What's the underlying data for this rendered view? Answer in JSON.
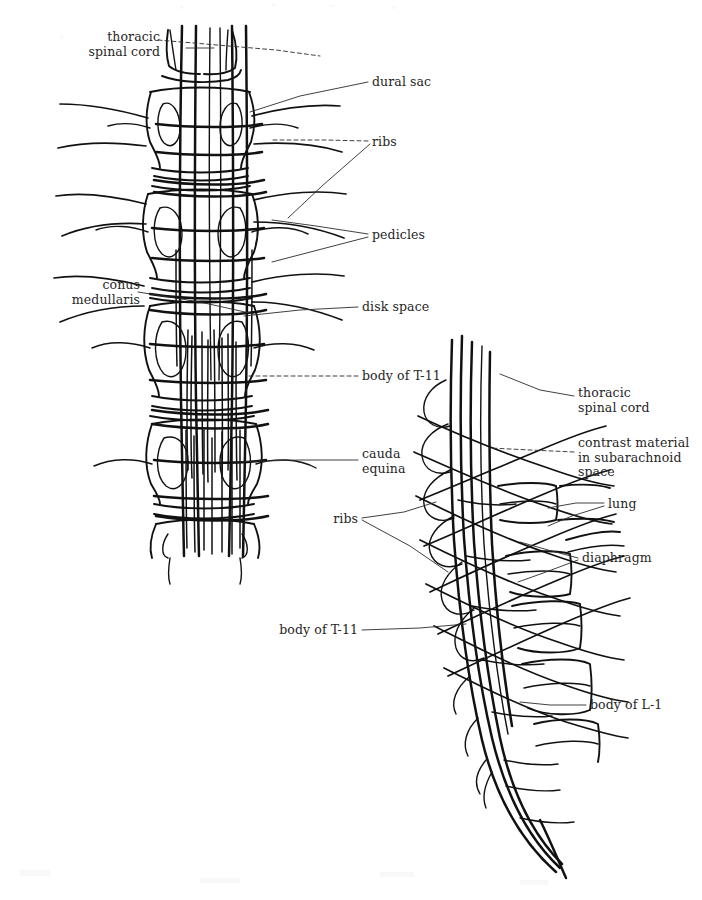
{
  "figure": {
    "background_color": "#ffffff",
    "ink_color": "#111111",
    "label_color": "#262626",
    "views": [
      {
        "name": "anteroposterior",
        "description": "AP myelogram of lower thoracic and upper lumbar spine"
      },
      {
        "name": "lateral",
        "description": "Lateral myelogram of lower thoracic and upper lumbar spine"
      }
    ]
  },
  "labels": {
    "ap_view": [
      {
        "id": "thoracic-spinal-cord",
        "text": "thoracic\nspinal cord",
        "align": "right",
        "x": 40,
        "y": 30,
        "width": 120
      },
      {
        "id": "conus-medullaris",
        "text": "conus\nmedullaris",
        "align": "right",
        "x": 30,
        "y": 278,
        "width": 110
      },
      {
        "id": "dural-sac",
        "text": "dural sac",
        "align": "left",
        "x": 372,
        "y": 75,
        "width": 110
      },
      {
        "id": "ribs",
        "text": "ribs",
        "align": "left",
        "x": 372,
        "y": 135,
        "width": 90
      },
      {
        "id": "pedicles",
        "text": "pedicles",
        "align": "left",
        "x": 372,
        "y": 228,
        "width": 110
      },
      {
        "id": "disk-space",
        "text": "disk space",
        "align": "left",
        "x": 362,
        "y": 300,
        "width": 110
      },
      {
        "id": "body-of-t11",
        "text": "body of T-11",
        "align": "left",
        "x": 362,
        "y": 369,
        "width": 120
      },
      {
        "id": "cauda-equina",
        "text": "cauda\nequina",
        "align": "left",
        "x": 362,
        "y": 447,
        "width": 100
      }
    ],
    "lateral_view": [
      {
        "id": "thoracic-spinal-cord-lat",
        "text": "thoracic\nspinal cord",
        "align": "left",
        "x": 578,
        "y": 386,
        "width": 120
      },
      {
        "id": "contrast-material",
        "text": "contrast material\nin subarachnoid\nspace",
        "align": "left",
        "x": 578,
        "y": 436,
        "width": 122
      },
      {
        "id": "lung",
        "text": "lung",
        "align": "left",
        "x": 608,
        "y": 497,
        "width": 70
      },
      {
        "id": "diaphragm",
        "text": "diaphragm",
        "align": "left",
        "x": 582,
        "y": 551,
        "width": 110
      },
      {
        "id": "ribs-lat",
        "text": "ribs",
        "align": "right",
        "x": 300,
        "y": 512,
        "width": 58
      },
      {
        "id": "body-of-t11-lat",
        "text": "body of T-11",
        "align": "right",
        "x": 258,
        "y": 623,
        "width": 100
      },
      {
        "id": "body-of-l1",
        "text": "body of L-1",
        "align": "left",
        "x": 590,
        "y": 698,
        "width": 110
      }
    ]
  }
}
